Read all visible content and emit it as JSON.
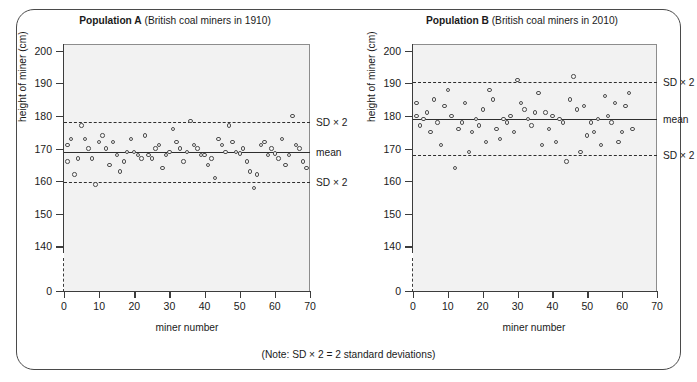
{
  "figure": {
    "note": "(Note: SD × 2 = 2 standard deviations)",
    "frame_color": "#4a4a4a",
    "plot_bg": "#f2f2f2",
    "point_color": "#4d4d4d"
  },
  "chart_data": [
    {
      "type": "scatter",
      "id": "population-a",
      "title_bold": "Population A",
      "title_sub": "(British coal miners in 1910)",
      "xlabel": "miner number",
      "ylabel": "height of miner (cm)",
      "xlim": [
        0,
        70
      ],
      "ylim": [
        138,
        202
      ],
      "xticks": [
        0,
        10,
        20,
        30,
        40,
        50,
        60,
        70
      ],
      "yticks": [
        140,
        150,
        160,
        170,
        180,
        190,
        200
      ],
      "y_axis_break_label": "0",
      "grid": false,
      "mean": 168.8,
      "mean_label": "mean",
      "sd_upper": 178.0,
      "sd_lower": 159.8,
      "sd_upper_label": "SD × 2",
      "sd_lower_label": "SD × 2",
      "x": [
        1,
        1,
        2,
        3,
        4,
        5,
        6,
        7,
        8,
        9,
        10,
        11,
        12,
        13,
        14,
        15,
        16,
        17,
        18,
        19,
        20,
        21,
        22,
        23,
        24,
        25,
        26,
        27,
        28,
        29,
        30,
        31,
        32,
        33,
        34,
        35,
        36,
        37,
        38,
        39,
        40,
        41,
        42,
        43,
        44,
        45,
        46,
        47,
        48,
        49,
        50,
        51,
        52,
        53,
        54,
        55,
        56,
        57,
        58,
        59,
        60,
        61,
        62,
        63,
        64,
        65,
        66,
        67,
        68,
        69
      ],
      "y": [
        166.0,
        171.0,
        173.0,
        162.0,
        167.0,
        177.0,
        173.0,
        170.0,
        167.0,
        159.0,
        172.0,
        174.0,
        170.0,
        165.0,
        172.0,
        168.0,
        163.0,
        166.0,
        169.0,
        173.0,
        169.0,
        168.0,
        167.0,
        174.0,
        168.0,
        167.0,
        170.0,
        171.0,
        164.0,
        168.0,
        169.0,
        176.0,
        172.0,
        170.0,
        166.0,
        169.0,
        178.5,
        171.0,
        170.0,
        168.0,
        168.0,
        165.0,
        167.0,
        161.0,
        173.0,
        171.0,
        169.0,
        177.0,
        172.0,
        169.0,
        168.5,
        170.0,
        166.0,
        163.0,
        158.0,
        162.0,
        171.0,
        172.0,
        168.0,
        170.0,
        168.5,
        167.0,
        173.0,
        165.0,
        168.0,
        180.0,
        171.0,
        170.0,
        166.0,
        164.0
      ]
    },
    {
      "type": "scatter",
      "id": "population-b",
      "title_bold": "Population B",
      "title_sub": "(British coal miners in 2010)",
      "xlabel": "miner number",
      "ylabel": "height of miner (cm)",
      "xlim": [
        0,
        70
      ],
      "ylim": [
        138,
        202
      ],
      "xticks": [
        0,
        10,
        20,
        30,
        40,
        50,
        60,
        70
      ],
      "yticks": [
        140,
        150,
        160,
        170,
        180,
        190,
        200
      ],
      "y_axis_break_label": "0",
      "grid": false,
      "mean": 179.0,
      "mean_label": "mean",
      "sd_upper": 190.3,
      "sd_lower": 168.0,
      "sd_upper_label": "SD × 2",
      "sd_lower_label": "SD × 2",
      "x": [
        1,
        1,
        2,
        3,
        4,
        5,
        6,
        7,
        8,
        9,
        10,
        11,
        12,
        13,
        14,
        15,
        16,
        17,
        18,
        19,
        20,
        21,
        22,
        23,
        24,
        25,
        26,
        27,
        28,
        29,
        30,
        31,
        32,
        33,
        34,
        35,
        36,
        37,
        38,
        39,
        40,
        41,
        42,
        43,
        44,
        45,
        46,
        47,
        48,
        49,
        50,
        51,
        52,
        53,
        54,
        55,
        56,
        57,
        58,
        59,
        60,
        61,
        62,
        63,
        64,
        65,
        66,
        67,
        68
      ],
      "y": [
        180.0,
        184.0,
        177.0,
        179.0,
        181.0,
        175.0,
        185.0,
        178.0,
        171.0,
        183.0,
        188.0,
        180.0,
        164.0,
        176.0,
        178.0,
        184.0,
        169.0,
        175.0,
        179.0,
        177.0,
        182.0,
        172.0,
        188.0,
        185.0,
        176.0,
        173.0,
        179.0,
        178.0,
        180.0,
        175.0,
        191.0,
        184.0,
        182.0,
        179.0,
        177.0,
        181.0,
        187.0,
        171.0,
        181.0,
        176.0,
        180.0,
        172.0,
        179.0,
        178.0,
        166.0,
        185.0,
        192.0,
        182.0,
        169.0,
        183.0,
        174.0,
        178.0,
        175.0,
        179.0,
        171.0,
        186.0,
        180.0,
        178.0,
        184.0,
        172.0,
        175.0,
        183.0,
        187.0,
        176.0
      ]
    }
  ]
}
